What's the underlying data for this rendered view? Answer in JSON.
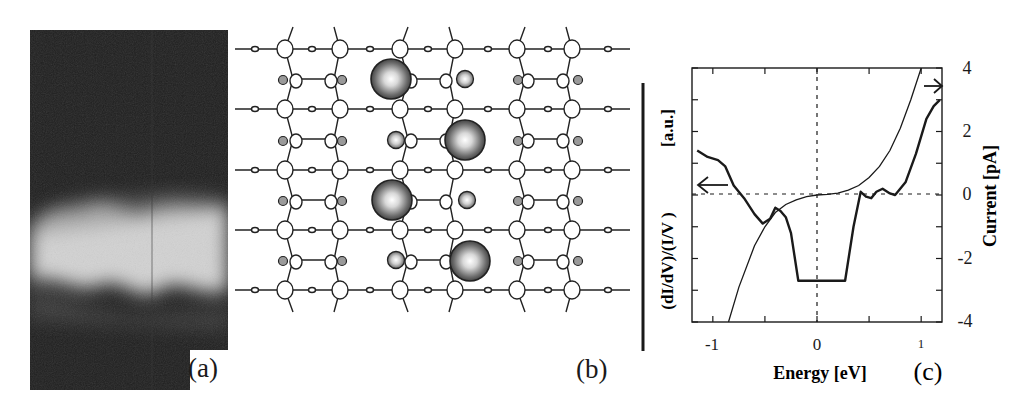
{
  "figure": {
    "panels": [
      {
        "id": "a",
        "label": "(a)",
        "type": "stm-image",
        "description": "grayscale STM topograph with bright zigzag band"
      },
      {
        "id": "b",
        "label": "(b)",
        "type": "lattice-diagram",
        "description": "ball-and-stick surface lattice with four large shaded adatoms"
      },
      {
        "id": "c",
        "label": "(c)",
        "type": "line-chart"
      }
    ]
  },
  "panel_a": {
    "label": "(a)"
  },
  "panel_b": {
    "label": "(b)"
  },
  "panel_c": {
    "label": "(c)",
    "xlabel": "Energy [eV]",
    "ylabel_left_num": "(dI/dV)/(I/V )",
    "ylabel_left_unit": "[a.u.]",
    "ylabel_right": "Current [pA]",
    "xticks": [
      "-1",
      "0",
      "1"
    ],
    "yticks_right": [
      "4",
      "2",
      "0",
      "-2",
      "-4"
    ]
  },
  "chart_data": {
    "type": "line",
    "title": "",
    "xlabel": "Energy [eV]",
    "ylabel_left": "(dI/dV)/(I/V) [a.u.]",
    "ylabel_right": "Current [pA]",
    "xlim": [
      -1.2,
      1.2
    ],
    "ylim_right": [
      -4,
      4
    ],
    "xticks": [
      -1,
      0,
      1
    ],
    "yticks_right": [
      -4,
      -2,
      0,
      2,
      4
    ],
    "grid": false,
    "reference_lines": [
      {
        "type": "vertical",
        "x": 0,
        "style": "dashed"
      },
      {
        "type": "horizontal",
        "y": 0,
        "style": "dashed"
      }
    ],
    "annotations": [
      {
        "type": "arrow",
        "direction": "left",
        "points_to": "left axis",
        "curve": "(dI/dV)/(I/V)"
      },
      {
        "type": "arrow",
        "direction": "right",
        "points_to": "right axis",
        "curve": "Current"
      }
    ],
    "series": [
      {
        "name": "Current (I-V)",
        "axis": "right",
        "style": "thin",
        "x": [
          -0.85,
          -0.75,
          -0.6,
          -0.5,
          -0.4,
          -0.3,
          -0.2,
          -0.1,
          0.0,
          0.1,
          0.2,
          0.3,
          0.4,
          0.5,
          0.6,
          0.7,
          0.8,
          0.9,
          1.0
        ],
        "y": [
          -4.0,
          -2.9,
          -1.6,
          -1.0,
          -0.55,
          -0.3,
          -0.15,
          -0.05,
          0.0,
          0.02,
          0.06,
          0.15,
          0.3,
          0.55,
          0.9,
          1.4,
          2.1,
          3.0,
          4.0
        ]
      },
      {
        "name": "(dI/dV)/(I/V)",
        "axis": "left",
        "style": "thick",
        "units": "a.u. (plotted in right-axis scale)",
        "x": [
          -1.15,
          -1.05,
          -0.95,
          -0.88,
          -0.8,
          -0.7,
          -0.6,
          -0.52,
          -0.45,
          -0.4,
          -0.35,
          -0.3,
          -0.25,
          -0.18,
          0.0,
          0.27,
          0.35,
          0.42,
          0.47,
          0.52,
          0.57,
          0.63,
          0.7,
          0.75,
          0.85,
          0.95,
          1.05,
          1.12,
          1.18
        ],
        "y": [
          1.4,
          1.2,
          1.1,
          0.9,
          0.3,
          -0.1,
          -0.6,
          -0.9,
          -0.75,
          -0.4,
          -0.5,
          -0.7,
          -1.2,
          -2.7,
          -2.7,
          -2.7,
          -1.0,
          0.1,
          -0.05,
          -0.1,
          0.1,
          0.2,
          0.05,
          0.0,
          0.4,
          1.3,
          2.4,
          2.8,
          3.0
        ]
      }
    ]
  }
}
